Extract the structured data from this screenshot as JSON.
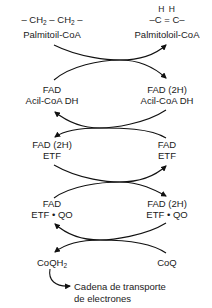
{
  "diagram": {
    "type": "coupled-reactions",
    "rows": [
      {
        "left": {
          "line1": "– CH",
          "line1_sub": "2",
          "line1_mid": " – CH",
          "line1_sub2": "2",
          "line1_end": " –",
          "line2": "Palmitoil-CoA"
        },
        "right": {
          "h_top": "H  H",
          "line1": "–C = C–",
          "line2": "Palmitoloil-CoA"
        }
      },
      {
        "left": {
          "line1": "FAD",
          "line2": "Acil-CoA DH"
        },
        "right": {
          "line1": "FAD (2H)",
          "line2": "Acil-CoA DH"
        }
      },
      {
        "left": {
          "line1": "FAD (2H)",
          "line2": "ETF"
        },
        "right": {
          "line1": "FAD",
          "line2": "ETF"
        }
      },
      {
        "left": {
          "line1": "FAD",
          "line2": "ETF • QO"
        },
        "right": {
          "line1": "FAD (2H)",
          "line2": "ETF • QO"
        }
      },
      {
        "left": {
          "line1": "CoQH",
          "line1_sub": "2"
        },
        "right": {
          "line1": "CoQ"
        }
      }
    ],
    "output": {
      "line1": "Cadena de transporte",
      "line2": "de electrones"
    },
    "arrow_direction": [
      "left-to-right",
      "right-to-left",
      "left-to-right",
      "right-to-left"
    ],
    "colors": {
      "text": "#1a1a1a",
      "arrow": "#111111",
      "background": "#ffffff"
    }
  }
}
